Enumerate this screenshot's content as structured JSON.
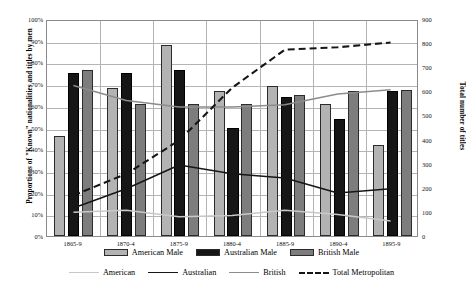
{
  "chart_data": {
    "type": "bar",
    "title": "",
    "subtitle": "",
    "xlabel": "",
    "ylabel": "Proportions of \"Known\" nationalities and titles by men",
    "y2label": "Total number of titles",
    "grid": true,
    "legend_position": "bottom",
    "categories": [
      "1865-9",
      "1870-4",
      "1875-9",
      "1880-4",
      "1885-9",
      "1890-4",
      "1895-9"
    ],
    "ylim": [
      0,
      100
    ],
    "ytick_labels": [
      "0%",
      "10%",
      "20%",
      "30%",
      "40%",
      "50%",
      "60%",
      "70%",
      "80%",
      "90%",
      "100%"
    ],
    "ytick_values": [
      0,
      10,
      20,
      30,
      40,
      50,
      60,
      70,
      80,
      90,
      100
    ],
    "y2lim": [
      0,
      900
    ],
    "y2tick_labels": [
      "0",
      "100",
      "200",
      "300",
      "400",
      "500",
      "600",
      "700",
      "800",
      "900"
    ],
    "y2tick_values": [
      0,
      100,
      200,
      300,
      400,
      500,
      600,
      700,
      800,
      900
    ],
    "series": [
      {
        "name": "American Male",
        "type": "bar",
        "axis": "left",
        "color": "#b3b3b3",
        "values": [
          46,
          68,
          88,
          67,
          69,
          61,
          42
        ]
      },
      {
        "name": "Australian Male",
        "type": "bar",
        "axis": "left",
        "color": "#161616",
        "values": [
          75,
          75,
          76.5,
          50,
          64,
          54,
          67
        ]
      },
      {
        "name": "British Male",
        "type": "bar",
        "axis": "left",
        "color": "#7d7d7d",
        "values": [
          76.5,
          61,
          61,
          61,
          65,
          67,
          67.5
        ]
      },
      {
        "name": "American",
        "type": "line",
        "axis": "left",
        "color": "#c8c8c8",
        "style": "solid",
        "values": [
          11,
          12,
          9,
          9.5,
          12,
          10,
          7
        ]
      },
      {
        "name": "Australian",
        "type": "line",
        "axis": "left",
        "color": "#161616",
        "style": "solid",
        "values": [
          13,
          22,
          33,
          29,
          27,
          20,
          22
        ]
      },
      {
        "name": "British",
        "type": "line",
        "axis": "left",
        "color": "#8c8c8c",
        "style": "solid",
        "values": [
          70,
          63,
          60,
          60,
          61,
          66,
          68
        ]
      },
      {
        "name": "Total Metropolitan",
        "type": "line",
        "axis": "right",
        "color": "#161616",
        "style": "dashed",
        "values": [
          170,
          260,
          400,
          620,
          780,
          790,
          810
        ]
      }
    ],
    "bar_legend": [
      {
        "label": "American Male",
        "color": "#b3b3b3"
      },
      {
        "label": "Australian Male",
        "color": "#161616"
      },
      {
        "label": "British Male",
        "color": "#7d7d7d"
      }
    ],
    "line_legend": [
      {
        "label": "American",
        "color": "#c8c8c8",
        "style": "solid"
      },
      {
        "label": "Australian",
        "color": "#161616",
        "style": "solid"
      },
      {
        "label": "British",
        "color": "#8c8c8c",
        "style": "solid"
      },
      {
        "label": "Total Metropolitan",
        "color": "#161616",
        "style": "dashed"
      }
    ]
  }
}
